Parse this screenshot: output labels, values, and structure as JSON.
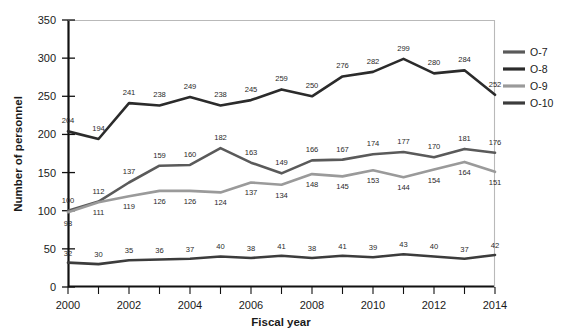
{
  "chart_data": {
    "type": "line",
    "title": "",
    "xlabel": "Fiscal year",
    "ylabel": "Number of personnel",
    "x": [
      2000,
      2001,
      2002,
      2003,
      2004,
      2005,
      2006,
      2007,
      2008,
      2009,
      2010,
      2011,
      2012,
      2013,
      2014
    ],
    "xtick_labels": [
      "2000",
      "2002",
      "2004",
      "2006",
      "2008",
      "2010",
      "2012",
      "2014"
    ],
    "xticks": [
      2000,
      2002,
      2004,
      2006,
      2008,
      2010,
      2012,
      2014
    ],
    "ytick_labels": [
      "0",
      "50",
      "100",
      "150",
      "200",
      "250",
      "300",
      "350"
    ],
    "yticks": [
      0,
      50,
      100,
      150,
      200,
      250,
      300,
      350
    ],
    "ylim": [
      0,
      350
    ],
    "xlim": [
      2000,
      2014
    ],
    "grid": false,
    "legend_position": "right",
    "series": [
      {
        "name": "O-7",
        "color": "#5a5a5a",
        "values": [
          100,
          112,
          137,
          159,
          160,
          182,
          163,
          149,
          166,
          167,
          174,
          177,
          170,
          181,
          176
        ]
      },
      {
        "name": "O-8",
        "color": "#2b2b2b",
        "values": [
          204,
          194,
          241,
          238,
          249,
          238,
          245,
          259,
          250,
          276,
          282,
          299,
          280,
          284,
          252
        ]
      },
      {
        "name": "O-9",
        "color": "#9a9a9a",
        "values": [
          98,
          111,
          119,
          126,
          126,
          124,
          137,
          134,
          148,
          145,
          153,
          144,
          154,
          164,
          151
        ]
      },
      {
        "name": "O-10",
        "color": "#3c3c3c",
        "values": [
          32,
          30,
          35,
          36,
          37,
          40,
          38,
          41,
          38,
          41,
          39,
          43,
          40,
          37,
          42
        ]
      }
    ]
  },
  "legend": {
    "items": [
      {
        "label": "O-7",
        "color": "#5a5a5a"
      },
      {
        "label": "O-8",
        "color": "#2b2b2b"
      },
      {
        "label": "O-9",
        "color": "#9a9a9a"
      },
      {
        "label": "O-10",
        "color": "#3c3c3c"
      }
    ]
  },
  "axes": {
    "y_title": "Number of personnel",
    "x_title": "Fiscal year"
  }
}
